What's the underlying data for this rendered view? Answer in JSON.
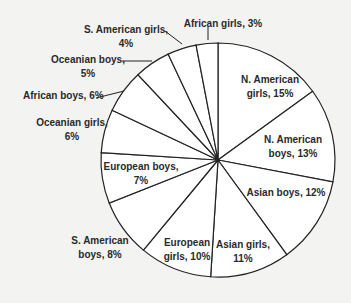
{
  "chart_data": {
    "type": "pie",
    "title": "",
    "start_angle_deg": 0,
    "direction": "clockwise",
    "categories": [
      "N. American girls",
      "N. American boys",
      "Asian boys",
      "Asian girls",
      "European girls",
      "S. American boys",
      "European boys",
      "Oceanian girls",
      "African boys",
      "Oceanian boys",
      "S. American girls",
      "African girls"
    ],
    "values": [
      15,
      13,
      12,
      11,
      10,
      8,
      7,
      6,
      6,
      5,
      4,
      3
    ],
    "unit": "%",
    "labels": [
      {
        "lines": [
          "N. American",
          "girls, 15%"
        ],
        "x": 270,
        "y": 83,
        "anchor": "middle"
      },
      {
        "lines": [
          "N. American",
          "boys, 13%"
        ],
        "x": 293,
        "y": 143,
        "anchor": "middle"
      },
      {
        "lines": [
          "Asian boys, 12%"
        ],
        "x": 286,
        "y": 196,
        "anchor": "middle"
      },
      {
        "lines": [
          "Asian girls,",
          "11%"
        ],
        "x": 243,
        "y": 248,
        "anchor": "middle"
      },
      {
        "lines": [
          "European",
          "girls, 10%"
        ],
        "x": 187,
        "y": 246,
        "anchor": "middle"
      },
      {
        "lines": [
          "S. American",
          "boys, 8%"
        ],
        "x": 100,
        "y": 244,
        "anchor": "middle"
      },
      {
        "lines": [
          "European boys,",
          "7%"
        ],
        "x": 141,
        "y": 170,
        "anchor": "middle"
      },
      {
        "lines": [
          "Oceanian girls,",
          "6%"
        ],
        "x": 72,
        "y": 126,
        "anchor": "middle"
      },
      {
        "lines": [
          "African boys, 6%"
        ],
        "x": 23,
        "y": 99,
        "anchor": "start"
      },
      {
        "lines": [
          "Oceanian boys,",
          "5%"
        ],
        "x": 88,
        "y": 63,
        "anchor": "middle"
      },
      {
        "lines": [
          "S. American girls,",
          "4%"
        ],
        "x": 126,
        "y": 33,
        "anchor": "middle"
      },
      {
        "lines": [
          "African girls, 3%"
        ],
        "x": 223,
        "y": 27,
        "anchor": "middle"
      }
    ],
    "leaders": [
      {
        "from": [
          165,
          31
        ],
        "to": [
          182,
          44
        ]
      },
      {
        "from": [
          122,
          61
        ],
        "to": [
          152,
          61
        ]
      },
      {
        "from": [
          96,
          98
        ],
        "to": [
          124,
          91
        ]
      },
      {
        "from": [
          208,
          27
        ],
        "to": [
          208,
          40
        ]
      }
    ],
    "geometry": {
      "cx": 218,
      "cy": 160,
      "r": 117
    },
    "colors": {
      "fill": "#ffffff",
      "stroke": "#222222",
      "background": "#f3f3f1"
    },
    "legend": "none"
  }
}
